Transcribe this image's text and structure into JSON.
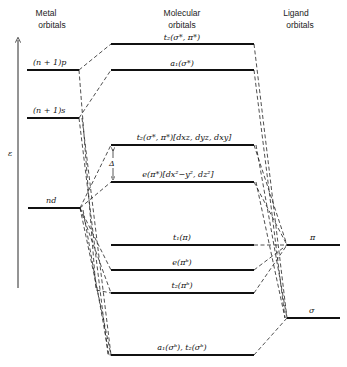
{
  "headers": {
    "metal": [
      "Metal",
      "orbitals"
    ],
    "molecular": [
      "Molecular",
      "orbitals"
    ],
    "ligand": [
      "Ligand",
      "orbitals"
    ]
  },
  "axis": {
    "label": "ε"
  },
  "metal_orbitals": [
    {
      "id": "np1p",
      "label": "(n + 1)p"
    },
    {
      "id": "np1s",
      "label": "(n + 1)s"
    },
    {
      "id": "nd",
      "label": "nd"
    }
  ],
  "molecular_orbitals": [
    {
      "id": "t2_star",
      "label": "t₂(σ*, π*)"
    },
    {
      "id": "a1_star",
      "label": "a₁(σ*)"
    },
    {
      "id": "t2_d",
      "label": "t₂(σ*, π*)[dxz, dyz, dxy]"
    },
    {
      "id": "e_d",
      "label": "e(π*)[dx²−y², dz²]"
    },
    {
      "id": "t1",
      "label": "t₁(π)"
    },
    {
      "id": "e_b",
      "label": "e(πᵇ)"
    },
    {
      "id": "t2_b",
      "label": "t₂(πᵇ)"
    },
    {
      "id": "a1t2_b",
      "label": "a₁(σᵇ), t₂(σᵇ)"
    }
  ],
  "ligand_orbitals": [
    {
      "id": "pi",
      "label": "π"
    },
    {
      "id": "sigma",
      "label": "σ"
    }
  ],
  "splitting": {
    "label": "Δ"
  }
}
